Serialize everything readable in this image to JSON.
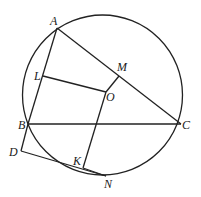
{
  "diagram": {
    "type": "geometry",
    "circle": {
      "center_label": "O",
      "cx": 102.5,
      "cy": 95,
      "r": 80
    },
    "points": {
      "A": {
        "label": "A",
        "x": 57,
        "y": 28
      },
      "B": {
        "label": "B",
        "x": 28,
        "y": 124
      },
      "C": {
        "label": "C",
        "x": 181,
        "y": 124
      },
      "O": {
        "label": "O",
        "x": 106,
        "y": 92
      },
      "L": {
        "label": "L",
        "x": 43,
        "y": 76
      },
      "M": {
        "label": "M",
        "x": 119,
        "y": 76
      },
      "K": {
        "label": "K",
        "x": 83,
        "y": 168
      },
      "D": {
        "label": "D",
        "x": 21,
        "y": 151
      },
      "N": {
        "label": "N",
        "x": 106,
        "y": 176
      }
    },
    "segments": [
      [
        "A",
        "B"
      ],
      [
        "A",
        "C"
      ],
      [
        "B",
        "C"
      ],
      [
        "L",
        "O"
      ],
      [
        "O",
        "M"
      ],
      [
        "O",
        "K"
      ],
      [
        "K",
        "N"
      ],
      [
        "B",
        "D"
      ],
      [
        "D",
        "N"
      ]
    ],
    "stroke_color": "#222222"
  }
}
